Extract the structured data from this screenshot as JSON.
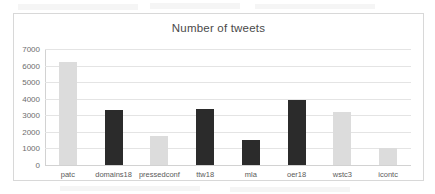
{
  "chart_data": {
    "type": "bar",
    "title": "Number of tweets",
    "xlabel": "",
    "ylabel": "",
    "ylim": [
      0,
      7000
    ],
    "grid": true,
    "legend": "none",
    "categories": [
      "patc",
      "domains18",
      "pressedconf",
      "ttw18",
      "mla",
      "oer18",
      "wstc3",
      "icontc"
    ],
    "values": [
      6200,
      3350,
      1760,
      3400,
      1520,
      3950,
      3180,
      1040
    ],
    "bar_colors": [
      "#dcdcdc",
      "#2b2b2b",
      "#dcdcdc",
      "#2b2b2b",
      "#2b2b2b",
      "#2b2b2b",
      "#dcdcdc",
      "#dcdcdc"
    ],
    "yticks": [
      7000,
      6000,
      5000,
      4000,
      3000,
      2000,
      1000,
      0
    ],
    "ytick_labels": [
      "7000",
      "6000",
      "5000",
      "4000",
      "3000",
      "2000",
      "1000",
      "0"
    ]
  }
}
